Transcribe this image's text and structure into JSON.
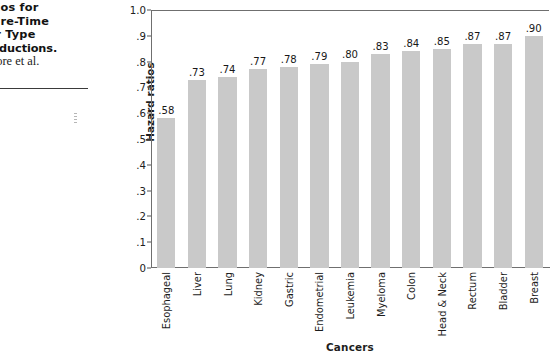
{
  "caption": {
    "lines": [
      "rd  Ratios  for",
      "r  Leisure-Time",
      "  Cancer  Type",
      "tisk Reductions.",
      "rom Moore et al."
    ]
  },
  "chart_data": {
    "type": "bar",
    "title": "",
    "xlabel": "Cancers",
    "ylabel": "Hazard ratios",
    "ylim": [
      0,
      1.0
    ],
    "ytick_values": [
      0,
      0.1,
      0.2,
      0.3,
      0.4,
      0.5,
      0.6,
      0.7,
      0.8,
      0.9,
      1.0
    ],
    "ytick_labels": [
      "0",
      ".1",
      ".2",
      ".3",
      ".4",
      ".5",
      ".6",
      ".7",
      ".8",
      ".9",
      "1.0"
    ],
    "grid": false,
    "legend": false,
    "bar_color": "#c9c9c9",
    "axis_color": "#6f6f6f",
    "categories": [
      "Esophageal",
      "Liver",
      "Lung",
      "Kidney",
      "Gastric",
      "Endometrial",
      "Leukemia",
      "Myeloma",
      "Colon",
      "Head & Neck",
      "Rectum",
      "Bladder",
      "Breast"
    ],
    "values": [
      0.58,
      0.73,
      0.74,
      0.77,
      0.78,
      0.79,
      0.8,
      0.83,
      0.84,
      0.85,
      0.87,
      0.87,
      0.9
    ],
    "value_labels": [
      ".58",
      ".73",
      ".74",
      ".77",
      ".78",
      ".79",
      ".80",
      ".83",
      ".84",
      ".85",
      ".87",
      ".87",
      ".90"
    ]
  }
}
